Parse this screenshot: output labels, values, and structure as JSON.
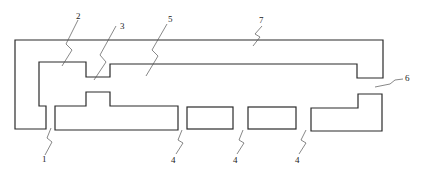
{
  "diagram": {
    "type": "cross-section schematic",
    "labels": [
      {
        "id": "label-1",
        "text": "1",
        "x": 44,
        "y": 160
      },
      {
        "id": "label-2",
        "text": "2",
        "x": 74,
        "y": 18
      },
      {
        "id": "label-3",
        "text": "3",
        "x": 121,
        "y": 28
      },
      {
        "id": "label-5",
        "text": "5",
        "x": 169,
        "y": 22
      },
      {
        "id": "label-7",
        "text": "7",
        "x": 261,
        "y": 24
      },
      {
        "id": "label-6",
        "text": "6",
        "x": 407,
        "y": 80
      },
      {
        "id": "label-4a",
        "text": "4",
        "x": 172,
        "y": 161
      },
      {
        "id": "label-4b",
        "text": "4",
        "x": 233,
        "y": 161
      },
      {
        "id": "label-4c",
        "text": "4",
        "x": 295,
        "y": 161
      }
    ],
    "stroke_color": "#2a2a2a",
    "background": "#ffffff"
  }
}
